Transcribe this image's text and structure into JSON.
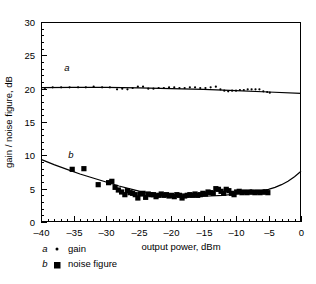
{
  "chart_data": {
    "type": "scatter",
    "title": "",
    "xlabel": "output power, dBm",
    "ylabel": "gain / noise figure, dB",
    "xlim": [
      -40,
      0
    ],
    "ylim": [
      0,
      30
    ],
    "xticks": [
      -40,
      -35,
      -30,
      -25,
      -20,
      -15,
      -10,
      -5,
      0
    ],
    "xtick_labels": [
      "–40",
      "–35",
      "–30",
      "–25",
      "–20",
      "–15",
      "–10",
      "–5",
      "0"
    ],
    "yticks": [
      0,
      5,
      10,
      15,
      20,
      25,
      30
    ],
    "ytick_labels": [
      "0",
      "5",
      "10",
      "15",
      "20",
      "25",
      "30"
    ],
    "x_minor_step": 1,
    "y_minor_step": 1,
    "grid": false,
    "legend_position": "below-left",
    "annotations": [
      {
        "text": "a",
        "x": -36.0,
        "y": 22.6,
        "italic": true
      },
      {
        "text": "b",
        "x": -35.4,
        "y": 9.6,
        "italic": true
      }
    ],
    "series": [
      {
        "name": "gain",
        "letter": "a",
        "marker": "dot",
        "marker_size": 2.2,
        "color": "#000000",
        "points": [
          {
            "x": -39.4,
            "y": 20.1
          },
          {
            "x": -38.2,
            "y": 20.2
          },
          {
            "x": -36.9,
            "y": 20.2
          },
          {
            "x": -35.6,
            "y": 20.2
          },
          {
            "x": -34.3,
            "y": 20.2
          },
          {
            "x": -33.1,
            "y": 20.2
          },
          {
            "x": -31.9,
            "y": 20.3
          },
          {
            "x": -30.6,
            "y": 20.2
          },
          {
            "x": -29.4,
            "y": 20.2
          },
          {
            "x": -28.3,
            "y": 19.9
          },
          {
            "x": -27.5,
            "y": 20.0
          },
          {
            "x": -26.7,
            "y": 19.9
          },
          {
            "x": -25.9,
            "y": 20.1
          },
          {
            "x": -25.1,
            "y": 20.3
          },
          {
            "x": -24.3,
            "y": 20.3
          },
          {
            "x": -23.5,
            "y": 20.0
          },
          {
            "x": -22.7,
            "y": 20.0
          },
          {
            "x": -21.9,
            "y": 20.1
          },
          {
            "x": -21.1,
            "y": 20.1
          },
          {
            "x": -20.3,
            "y": 20.2
          },
          {
            "x": -19.5,
            "y": 20.2
          },
          {
            "x": -18.7,
            "y": 20.1
          },
          {
            "x": -17.9,
            "y": 20.1
          },
          {
            "x": -17.1,
            "y": 20.2
          },
          {
            "x": -16.3,
            "y": 20.2
          },
          {
            "x": -15.5,
            "y": 20.1
          },
          {
            "x": -14.7,
            "y": 20.1
          },
          {
            "x": -13.9,
            "y": 20.2
          },
          {
            "x": -13.1,
            "y": 20.3
          },
          {
            "x": -12.4,
            "y": 19.9
          },
          {
            "x": -11.8,
            "y": 19.7
          },
          {
            "x": -11.2,
            "y": 19.6
          },
          {
            "x": -10.6,
            "y": 19.7
          },
          {
            "x": -10.0,
            "y": 19.7
          },
          {
            "x": -9.4,
            "y": 19.8
          },
          {
            "x": -8.8,
            "y": 19.8
          },
          {
            "x": -8.2,
            "y": 19.9
          },
          {
            "x": -7.6,
            "y": 19.9
          },
          {
            "x": -7.0,
            "y": 19.9
          },
          {
            "x": -6.4,
            "y": 19.9
          },
          {
            "x": -5.8,
            "y": 19.6
          },
          {
            "x": -5.2,
            "y": 19.5
          },
          {
            "x": -4.8,
            "y": 19.4
          }
        ],
        "fit": [
          {
            "x": -40.0,
            "y": 20.15
          },
          {
            "x": -35.0,
            "y": 20.18
          },
          {
            "x": -30.0,
            "y": 20.18
          },
          {
            "x": -25.0,
            "y": 20.12
          },
          {
            "x": -20.0,
            "y": 20.02
          },
          {
            "x": -15.0,
            "y": 19.88
          },
          {
            "x": -10.0,
            "y": 19.7
          },
          {
            "x": -5.0,
            "y": 19.5
          },
          {
            "x": 0.0,
            "y": 19.28
          }
        ]
      },
      {
        "name": "noise figure",
        "letter": "b",
        "marker": "square",
        "marker_size": 5.2,
        "color": "#000000",
        "points": [
          {
            "x": -35.2,
            "y": 7.9
          },
          {
            "x": -33.4,
            "y": 8.0
          },
          {
            "x": -31.2,
            "y": 5.6
          },
          {
            "x": -29.6,
            "y": 5.9
          },
          {
            "x": -29.1,
            "y": 6.1
          },
          {
            "x": -28.6,
            "y": 5.2
          },
          {
            "x": -28.1,
            "y": 4.8
          },
          {
            "x": -27.6,
            "y": 4.5
          },
          {
            "x": -27.1,
            "y": 4.1
          },
          {
            "x": -26.7,
            "y": 4.7
          },
          {
            "x": -26.3,
            "y": 4.4
          },
          {
            "x": -25.9,
            "y": 4.3
          },
          {
            "x": -25.5,
            "y": 4.1
          },
          {
            "x": -25.1,
            "y": 3.6
          },
          {
            "x": -24.7,
            "y": 4.2
          },
          {
            "x": -24.3,
            "y": 4.3
          },
          {
            "x": -23.9,
            "y": 3.7
          },
          {
            "x": -23.5,
            "y": 4.2
          },
          {
            "x": -23.1,
            "y": 4.1
          },
          {
            "x": -22.7,
            "y": 4.1
          },
          {
            "x": -22.3,
            "y": 3.8
          },
          {
            "x": -21.9,
            "y": 4.0
          },
          {
            "x": -21.5,
            "y": 4.2
          },
          {
            "x": -21.1,
            "y": 4.0
          },
          {
            "x": -20.7,
            "y": 4.1
          },
          {
            "x": -20.3,
            "y": 3.9
          },
          {
            "x": -19.9,
            "y": 4.0
          },
          {
            "x": -19.5,
            "y": 3.8
          },
          {
            "x": -19.1,
            "y": 4.1
          },
          {
            "x": -18.7,
            "y": 4.0
          },
          {
            "x": -18.3,
            "y": 3.6
          },
          {
            "x": -17.9,
            "y": 3.9
          },
          {
            "x": -17.5,
            "y": 4.0
          },
          {
            "x": -17.1,
            "y": 4.1
          },
          {
            "x": -16.7,
            "y": 4.0
          },
          {
            "x": -16.3,
            "y": 4.2
          },
          {
            "x": -15.9,
            "y": 4.0
          },
          {
            "x": -15.5,
            "y": 4.1
          },
          {
            "x": -15.1,
            "y": 4.3
          },
          {
            "x": -14.7,
            "y": 4.2
          },
          {
            "x": -14.3,
            "y": 4.5
          },
          {
            "x": -13.9,
            "y": 4.4
          },
          {
            "x": -13.5,
            "y": 4.3
          },
          {
            "x": -13.1,
            "y": 5.0
          },
          {
            "x": -12.7,
            "y": 4.9
          },
          {
            "x": -12.3,
            "y": 4.6
          },
          {
            "x": -11.9,
            "y": 4.3
          },
          {
            "x": -11.5,
            "y": 4.9
          },
          {
            "x": -11.1,
            "y": 4.7
          },
          {
            "x": -10.7,
            "y": 4.3
          },
          {
            "x": -10.3,
            "y": 4.1
          },
          {
            "x": -9.9,
            "y": 4.5
          },
          {
            "x": -9.5,
            "y": 4.6
          },
          {
            "x": -9.1,
            "y": 4.4
          },
          {
            "x": -8.7,
            "y": 4.5
          },
          {
            "x": -8.3,
            "y": 4.4
          },
          {
            "x": -7.9,
            "y": 4.5
          },
          {
            "x": -7.5,
            "y": 4.5
          },
          {
            "x": -7.1,
            "y": 4.4
          },
          {
            "x": -6.7,
            "y": 4.5
          },
          {
            "x": -6.3,
            "y": 4.4
          },
          {
            "x": -5.9,
            "y": 4.5
          },
          {
            "x": -5.5,
            "y": 4.5
          },
          {
            "x": -5.1,
            "y": 4.4
          }
        ],
        "fit": [
          {
            "x": -40.0,
            "y": 9.4
          },
          {
            "x": -38.0,
            "y": 8.6
          },
          {
            "x": -36.0,
            "y": 7.9
          },
          {
            "x": -34.0,
            "y": 7.2
          },
          {
            "x": -32.0,
            "y": 6.6
          },
          {
            "x": -30.0,
            "y": 6.0
          },
          {
            "x": -28.0,
            "y": 5.4
          },
          {
            "x": -26.0,
            "y": 4.9
          },
          {
            "x": -24.0,
            "y": 4.4
          },
          {
            "x": -22.0,
            "y": 4.1
          },
          {
            "x": -20.0,
            "y": 3.9
          },
          {
            "x": -18.0,
            "y": 3.8
          },
          {
            "x": -16.0,
            "y": 3.8
          },
          {
            "x": -14.0,
            "y": 3.9
          },
          {
            "x": -12.0,
            "y": 4.0
          },
          {
            "x": -10.0,
            "y": 4.2
          },
          {
            "x": -8.0,
            "y": 4.4
          },
          {
            "x": -6.0,
            "y": 4.7
          },
          {
            "x": -5.0,
            "y": 4.9
          },
          {
            "x": -4.0,
            "y": 5.2
          },
          {
            "x": -3.0,
            "y": 5.6
          },
          {
            "x": -2.0,
            "y": 6.1
          },
          {
            "x": -1.0,
            "y": 6.8
          },
          {
            "x": 0.0,
            "y": 7.6
          }
        ]
      }
    ],
    "legend": [
      {
        "letter": "a",
        "marker": "dot",
        "label": "gain"
      },
      {
        "letter": "b",
        "marker": "square",
        "label": "noise figure"
      }
    ]
  }
}
